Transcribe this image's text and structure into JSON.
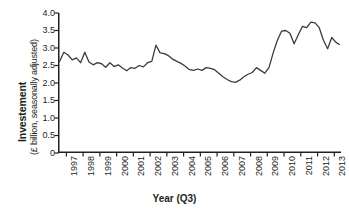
{
  "chart_data": {
    "type": "line",
    "title": "",
    "xlabel": "Year (Q3)",
    "ylabel": "Investement\n(£ billion, seasonally adjusted)",
    "ylabel_line1": "Investement",
    "ylabel_line2": "(£ billion, seasonally adjusted)",
    "ylim": [
      0,
      4.0
    ],
    "y_ticks": [
      0,
      0.5,
      1.0,
      1.5,
      2.0,
      2.5,
      3.0,
      3.5,
      4.0
    ],
    "y_tick_labels": [
      "0",
      "0.5",
      "1.0",
      "1.5",
      "2.0",
      "2.5",
      "3.0",
      "3.5",
      "4.0"
    ],
    "xlim": [
      1996.5,
      2013.4
    ],
    "x_ticks": [
      1997,
      1998,
      1999,
      2000,
      2001,
      2002,
      2003,
      2004,
      2005,
      2006,
      2007,
      2008,
      2009,
      2010,
      2011,
      2012,
      2013
    ],
    "x_tick_labels": [
      "1997",
      "1998",
      "1999",
      "2000",
      "2001",
      "2002",
      "2003",
      "2004",
      "2005",
      "2006",
      "2007",
      "2008",
      "2009",
      "2010",
      "2011",
      "2012",
      "2013"
    ],
    "grid": false,
    "legend": null,
    "line_color": "#3b3b3b",
    "series": [
      {
        "name": "Investment (£ billion, seasonally adjusted)",
        "x": [
          1996.6,
          1996.85,
          1997.1,
          1997.35,
          1997.6,
          1997.85,
          1998.1,
          1998.35,
          1998.6,
          1998.85,
          1999.1,
          1999.35,
          1999.6,
          1999.85,
          2000.1,
          2000.35,
          2000.6,
          2000.85,
          2001.1,
          2001.35,
          2001.6,
          2001.85,
          2002.1,
          2002.35,
          2002.6,
          2002.85,
          2003.1,
          2003.35,
          2003.6,
          2003.85,
          2004.1,
          2004.35,
          2004.6,
          2004.85,
          2005.1,
          2005.35,
          2005.6,
          2005.85,
          2006.1,
          2006.35,
          2006.6,
          2006.85,
          2007.1,
          2007.35,
          2007.6,
          2007.85,
          2008.1,
          2008.35,
          2008.6,
          2008.85,
          2009.1,
          2009.35,
          2009.6,
          2009.85,
          2010.1,
          2010.35,
          2010.6,
          2010.85,
          2011.1,
          2011.35,
          2011.6,
          2011.85,
          2012.1,
          2012.35,
          2012.6,
          2012.85,
          2013.1,
          2013.3
        ],
        "values": [
          2.62,
          2.88,
          2.8,
          2.66,
          2.72,
          2.58,
          2.88,
          2.6,
          2.52,
          2.58,
          2.55,
          2.45,
          2.58,
          2.47,
          2.52,
          2.43,
          2.35,
          2.44,
          2.42,
          2.5,
          2.46,
          2.58,
          2.62,
          3.08,
          2.86,
          2.84,
          2.78,
          2.68,
          2.62,
          2.56,
          2.48,
          2.38,
          2.36,
          2.4,
          2.36,
          2.44,
          2.42,
          2.38,
          2.28,
          2.18,
          2.1,
          2.04,
          2.02,
          2.08,
          2.18,
          2.25,
          2.3,
          2.44,
          2.36,
          2.28,
          2.44,
          2.86,
          3.22,
          3.48,
          3.5,
          3.42,
          3.12,
          3.38,
          3.62,
          3.58,
          3.74,
          3.72,
          3.58,
          3.22,
          2.98,
          3.3,
          3.16,
          3.1
        ]
      }
    ]
  },
  "axis": {
    "y_title_main": "Investement",
    "y_title_sub": "(£ billion, seasonally adjusted)",
    "x_title": "Year (Q3)"
  }
}
